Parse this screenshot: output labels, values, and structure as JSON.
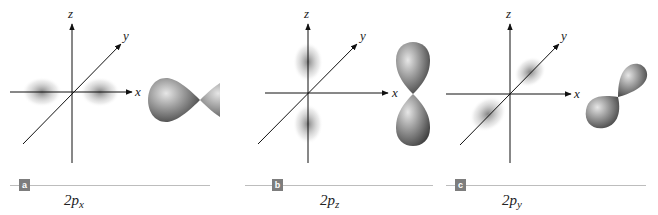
{
  "figure": {
    "panels": [
      {
        "tag": "a",
        "axes": {
          "x": "x",
          "y": "y",
          "z": "z"
        },
        "caption_main": "2p",
        "caption_sub": "x",
        "orientation": "x"
      },
      {
        "tag": "b",
        "axes": {
          "x": "x",
          "y": "y",
          "z": "z"
        },
        "caption_main": "2p",
        "caption_sub": "z",
        "orientation": "z"
      },
      {
        "tag": "c",
        "axes": {
          "x": "x",
          "y": "y",
          "z": "z"
        },
        "caption_main": "2p",
        "caption_sub": "y",
        "orientation": "y"
      }
    ],
    "colors": {
      "axis": "#111111",
      "lobe_dark": "#4a4a4a",
      "lobe_light": "#d9d9d9",
      "cloud": "#8a8a8a",
      "tag_bg": "#7d7d7d",
      "divider": "#bdbdbd"
    }
  }
}
